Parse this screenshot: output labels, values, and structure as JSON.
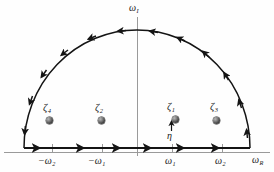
{
  "figure": {
    "name": "semicircular-contour-complex-plane",
    "background": "#fefefe",
    "axis_color": "#8c8c8c",
    "contour_color": "#141414",
    "pole_color": "#3a3a3a"
  },
  "axes": {
    "vertical_label": "ω",
    "vertical_sub": "I",
    "horizontal_label": "ω",
    "horizontal_sub": "R",
    "origin_x": 137,
    "baseline_y": 152
  },
  "ticks": [
    {
      "label": "−ω",
      "sub": "2",
      "x": 52
    },
    {
      "label": "−ω",
      "sub": "1",
      "x": 102
    },
    {
      "label": "ω",
      "sub": "1",
      "x": 172
    },
    {
      "label": "ω",
      "sub": "2",
      "x": 222
    }
  ],
  "poles": [
    {
      "label": "ζ",
      "sub": "4",
      "x": 49,
      "y": 120
    },
    {
      "label": "ζ",
      "sub": "2",
      "x": 101,
      "y": 120
    },
    {
      "label": "ζ",
      "sub": "1",
      "x": 172,
      "y": 119
    },
    {
      "label": "ζ",
      "sub": "3",
      "x": 216,
      "y": 120
    }
  ],
  "annotation": {
    "eta_label": "η",
    "eta_x": 170,
    "eta_y": 133
  },
  "contour": {
    "direction": "counterclockwise",
    "arc_center_x": 137,
    "arc_radius_x": 113,
    "arc_radius_y": 118,
    "base_from_x": 24,
    "base_to_x": 250,
    "base_y": 148
  }
}
